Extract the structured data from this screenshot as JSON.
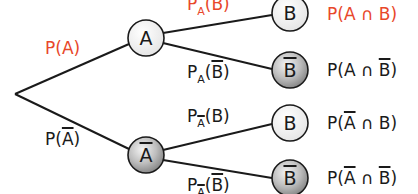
{
  "colors": {
    "highlight": "#e8472a",
    "text": "#1a1a1a",
    "line": "#1a1a1a"
  },
  "nodes": {
    "A": "A",
    "not_A": "A",
    "B1": "B",
    "not_B1": "B",
    "B2": "B",
    "not_B2": "B"
  },
  "edges": {
    "root_A": {
      "P": "P(",
      "ev": "A",
      "close": ")"
    },
    "root_notA": {
      "P": "P(",
      "ev": "A",
      "close": ")"
    },
    "A_B": {
      "P": "P",
      "sub": "A",
      "ev": "(B)"
    },
    "A_notB": {
      "P": "P",
      "sub": "A",
      "open": "(",
      "ev": "B",
      "close": ")"
    },
    "notA_B": {
      "P": "P",
      "sub": "A",
      "ev": "(B)"
    },
    "notA_notB": {
      "P": "P",
      "sub": "A",
      "open": "(",
      "ev": "B",
      "close": ")"
    }
  },
  "outcomes": {
    "AB": {
      "pre": "P(A ∩ B)"
    },
    "AnotB": {
      "pre": "P(A ∩ ",
      "ev": "B",
      "close": ")"
    },
    "notAB": {
      "pre": "P(",
      "ev": "A",
      "post": " ∩ B)"
    },
    "notAnotB": {
      "pre": "P(",
      "ev1": "A",
      "mid": " ∩ ",
      "ev2": "B",
      "close": ")"
    }
  }
}
